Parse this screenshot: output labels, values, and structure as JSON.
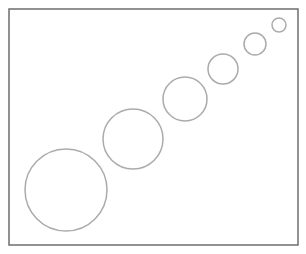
{
  "diagram": {
    "frame": {
      "x": 9,
      "y": 9,
      "width": 289,
      "height": 236,
      "stroke": "#6e6e6e",
      "stroke_width": 1.5
    },
    "circle_style": {
      "stroke": "#ababab",
      "stroke_width": 1.5,
      "fill": "none"
    },
    "circles": [
      {
        "cx": 66,
        "cy": 190,
        "r": 41
      },
      {
        "cx": 133,
        "cy": 139,
        "r": 30
      },
      {
        "cx": 185,
        "cy": 99,
        "r": 22
      },
      {
        "cx": 223,
        "cy": 69,
        "r": 15
      },
      {
        "cx": 255,
        "cy": 44,
        "r": 11
      },
      {
        "cx": 279,
        "cy": 25,
        "r": 7
      }
    ]
  }
}
